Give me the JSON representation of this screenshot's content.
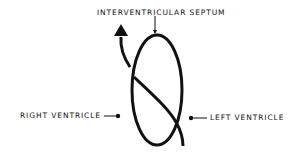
{
  "diagram": {
    "labels": {
      "septum": "INTERVENTRICULAR SEPTUM",
      "right_ventricle": "RIGHT VENTRICLE",
      "left_ventricle": "LEFT VENTRICLE"
    },
    "colors": {
      "stroke": "#111111",
      "background": "#ffffff"
    }
  }
}
